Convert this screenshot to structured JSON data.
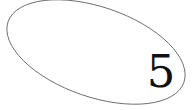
{
  "canvas": {
    "width": 193,
    "height": 110,
    "background_color": "#ffffff",
    "title": "Ellipse Annotation"
  },
  "shapes": [
    {
      "name": "ellipse-outline",
      "type": "ellipse",
      "center_x": 96,
      "center_y": 52,
      "radius_x": 93,
      "radius_y": 45,
      "rotation_deg": 19,
      "stroke_color": "#6e6e6e",
      "stroke_width": 1,
      "fill": "none"
    }
  ],
  "labels": {
    "number_label": {
      "text": "5",
      "color": "#111111",
      "x": 161,
      "y": 74,
      "font_size": 45
    }
  }
}
